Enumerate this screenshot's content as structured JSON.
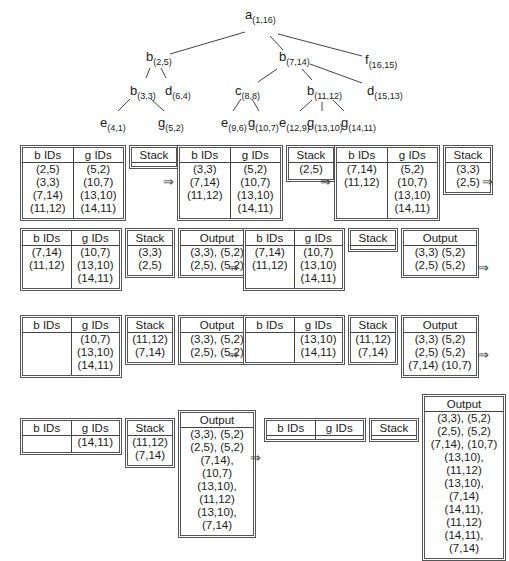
{
  "tree": {
    "nodes": [
      {
        "id": "a",
        "label": "a",
        "sub": "(1,16)",
        "x": 245,
        "y": 8
      },
      {
        "id": "b25",
        "label": "b",
        "sub": "(2,5)",
        "x": 146,
        "y": 50
      },
      {
        "id": "b714",
        "label": "b",
        "sub": "(7,14)",
        "x": 279,
        "y": 50
      },
      {
        "id": "f",
        "label": "f",
        "sub": "(16,15)",
        "x": 365,
        "y": 53
      },
      {
        "id": "b33",
        "label": "b",
        "sub": "(3,3)",
        "x": 130,
        "y": 84
      },
      {
        "id": "d64",
        "label": "d",
        "sub": "(6,4)",
        "x": 165,
        "y": 84
      },
      {
        "id": "c",
        "label": "c",
        "sub": "(8,8)",
        "x": 235,
        "y": 84
      },
      {
        "id": "b1112",
        "label": "b",
        "sub": "(11,12)",
        "x": 307,
        "y": 84
      },
      {
        "id": "d1513",
        "label": "d",
        "sub": "(15,13)",
        "x": 367,
        "y": 84
      },
      {
        "id": "e41",
        "label": "e",
        "sub": "(4,1)",
        "x": 100,
        "y": 116
      },
      {
        "id": "g52",
        "label": "g",
        "sub": "(5,2)",
        "x": 158,
        "y": 116
      },
      {
        "id": "e96",
        "label": "e",
        "sub": "(9,6)",
        "x": 221,
        "y": 116
      },
      {
        "id": "g107",
        "label": "g",
        "sub": "(10,7)",
        "x": 248,
        "y": 116
      },
      {
        "id": "e129",
        "label": "e",
        "sub": "(12,9)",
        "x": 279,
        "y": 116
      },
      {
        "id": "g1310",
        "label": "g",
        "sub": "(13,10)",
        "x": 307,
        "y": 116
      },
      {
        "id": "g1411",
        "label": "g",
        "sub": "(14,11)",
        "x": 341,
        "y": 116
      }
    ],
    "edges": [
      [
        245,
        32,
        170,
        54
      ],
      [
        270,
        36,
        283,
        50
      ],
      [
        278,
        34,
        362,
        56
      ],
      [
        150,
        68,
        146,
        78
      ],
      [
        161,
        68,
        166,
        78
      ],
      [
        277,
        69,
        258,
        82
      ],
      [
        302,
        69,
        312,
        80
      ],
      [
        310,
        64,
        362,
        83
      ],
      [
        130,
        99,
        118,
        111
      ],
      [
        151,
        99,
        164,
        111
      ],
      [
        241,
        99,
        233,
        111
      ],
      [
        252,
        99,
        259,
        111
      ],
      [
        312,
        100,
        300,
        111
      ],
      [
        322,
        102,
        322,
        111
      ],
      [
        333,
        100,
        344,
        111
      ]
    ]
  },
  "headers": {
    "b": "b IDs",
    "g": "g IDs",
    "stack": "Stack",
    "output": "Output"
  },
  "arrow": "⇒",
  "steps": [
    {
      "x": 20,
      "y": 145,
      "rows": 4,
      "b": [
        "(2,5)",
        "(3,3)",
        "(7,14)",
        "(11,12)"
      ],
      "g": [
        "(5,2)",
        "(10,7)",
        "(13,10)",
        "(14,11)"
      ],
      "stack": [],
      "output": null
    },
    {
      "x": 177,
      "y": 145,
      "rows": 4,
      "b": [
        "(3,3)",
        "(7,14)",
        "(11,12)",
        ""
      ],
      "g": [
        "(5,2)",
        "(10,7)",
        "(13,10)",
        "(14,11)"
      ],
      "stack": [
        "",
        "",
        "",
        "(2,5)"
      ],
      "output": null
    },
    {
      "x": 334,
      "y": 145,
      "rows": 4,
      "b": [
        "(7,14)",
        "(11,12)",
        "",
        ""
      ],
      "g": [
        "(5,2)",
        "(10,7)",
        "(13,10)",
        "(14,11)"
      ],
      "stack": [
        "",
        "",
        "(3,3)",
        "(2,5)"
      ],
      "output": null
    },
    {
      "x": 20,
      "y": 228,
      "rows": 5,
      "b": [
        "(7,14)",
        "(11,12)",
        "",
        "",
        ""
      ],
      "g": [
        "(10,7)",
        "(13,10)",
        "(14,11)",
        "",
        ""
      ],
      "stack": [
        "",
        "",
        "",
        "(3,3)",
        "(2,5)"
      ],
      "output": [
        "(3,3), (5,2)",
        "(2,5), (5,2)",
        "",
        "",
        ""
      ]
    },
    {
      "x": 243,
      "y": 228,
      "rows": 5,
      "b": [
        "(7,14)",
        "(11,12)",
        "",
        "",
        ""
      ],
      "g": [
        "(10,7)",
        "(13,10)",
        "(14,11)",
        "",
        ""
      ],
      "stack": [
        "",
        "",
        "",
        "",
        ""
      ],
      "output": [
        "(3,3) (5,2)",
        "(2,5) (5,2)",
        "",
        "",
        ""
      ]
    },
    {
      "x": 20,
      "y": 315,
      "rows": 5,
      "b": [
        "",
        "",
        "",
        "",
        ""
      ],
      "g": [
        "(10,7)",
        "(13,10)",
        "(14,11)",
        "",
        ""
      ],
      "stack": [
        "",
        "",
        "",
        "(11,12)",
        "(7,14)"
      ],
      "output": [
        "(3,3), (5,2)",
        "(2,5), (5,2)",
        "",
        "",
        ""
      ]
    },
    {
      "x": 243,
      "y": 315,
      "rows": 5,
      "b": [
        "",
        "",
        "",
        "",
        ""
      ],
      "g": [
        "(13,10)",
        "(14,11)",
        "",
        "",
        ""
      ],
      "stack": [
        "",
        "",
        "",
        "(11,12)",
        "(7,14)"
      ],
      "output": [
        "(3,3) (5,2)",
        "(2,5) (5,2)",
        "(7,14) (10,7)",
        "",
        ""
      ]
    },
    {
      "x": 20,
      "y": 418,
      "rows": 5,
      "b": [
        "",
        "",
        "",
        "",
        ""
      ],
      "g": [
        "(14,11)",
        "",
        "",
        "",
        ""
      ],
      "stack": [
        "",
        "",
        "",
        "(11,12)",
        "(7,14)"
      ],
      "output": [
        "(3,3), (5,2)",
        "(2,5), (5,2)",
        "(7,14), (10,7)",
        "(13,10), (11,12)",
        "(13,10),  (7,14)"
      ]
    },
    {
      "x": 264,
      "y": 418,
      "rows": 5,
      "b": [
        "",
        "",
        "",
        "",
        ""
      ],
      "g": [
        "",
        "",
        "",
        "",
        ""
      ],
      "stack": [
        "",
        "",
        "",
        "",
        ""
      ],
      "output": [
        "(3,3), (5,2)",
        "(2,5), (5,2)",
        "(7,14), (10,7)",
        "(13,10), (11,12)",
        "(13,10), (7,14)",
        "(14,11), (11,12)",
        "(14,11), (7,14)"
      ]
    }
  ],
  "arrows": [
    {
      "x": 163,
      "y": 174
    },
    {
      "x": 320,
      "y": 174
    },
    {
      "x": 482,
      "y": 174
    },
    {
      "x": 228,
      "y": 260
    },
    {
      "x": 478,
      "y": 260
    },
    {
      "x": 228,
      "y": 347
    },
    {
      "x": 478,
      "y": 347
    },
    {
      "x": 250,
      "y": 450
    }
  ]
}
